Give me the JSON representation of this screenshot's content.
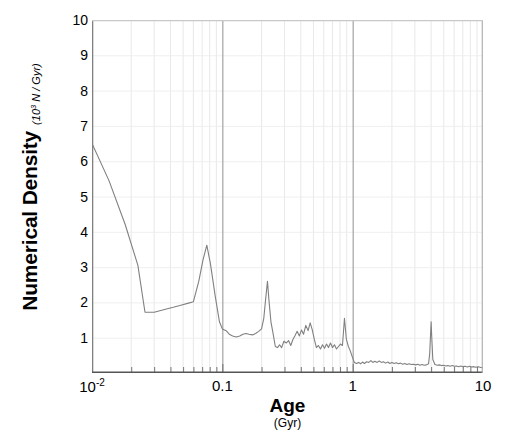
{
  "axes": {
    "y_title": "Numerical Density",
    "y_subtitle_pre": "(10",
    "y_subtitle_sup": "3",
    "y_subtitle_post": " N / Gyr)",
    "x_title": "Age",
    "x_subtitle": "(Gyr)"
  },
  "chart_data": {
    "type": "line",
    "title": "",
    "xlabel": "Age (Gyr)",
    "ylabel": "Numerical Density (10^3 N / Gyr)",
    "xscale": "log",
    "yscale": "linear",
    "xlim": [
      0.01,
      10
    ],
    "ylim": [
      0,
      10
    ],
    "grid": true,
    "grid_minor": true,
    "legend": null,
    "line_color": "#808080",
    "y_ticks": [
      1,
      2,
      3,
      4,
      5,
      6,
      7,
      8,
      9,
      10
    ],
    "y_ticklabels": [
      "1",
      "2",
      "3",
      "4",
      "5",
      "6",
      "7",
      "8",
      "9",
      "10"
    ],
    "x_ticks": [
      0.01,
      0.1,
      1,
      10
    ],
    "x_ticklabels": [
      "10-2",
      "0.1",
      "1",
      "10"
    ],
    "series": [
      {
        "name": "numerical density",
        "x": [
          0.01,
          0.0135,
          0.018,
          0.0225,
          0.0255,
          0.03,
          0.036,
          0.042,
          0.048,
          0.055,
          0.06,
          0.066,
          0.071,
          0.076,
          0.081,
          0.088,
          0.095,
          0.1,
          0.107,
          0.113,
          0.12,
          0.128,
          0.136,
          0.144,
          0.152,
          0.16,
          0.17,
          0.18,
          0.19,
          0.2,
          0.208,
          0.215,
          0.222,
          0.228,
          0.236,
          0.245,
          0.255,
          0.265,
          0.275,
          0.285,
          0.297,
          0.31,
          0.322,
          0.335,
          0.348,
          0.36,
          0.375,
          0.39,
          0.405,
          0.42,
          0.437,
          0.455,
          0.472,
          0.49,
          0.508,
          0.527,
          0.546,
          0.566,
          0.587,
          0.608,
          0.63,
          0.652,
          0.676,
          0.7,
          0.725,
          0.751,
          0.778,
          0.806,
          0.835,
          0.865,
          0.895,
          0.927,
          0.96,
          0.995,
          1.03,
          1.07,
          1.11,
          1.15,
          1.19,
          1.23,
          1.28,
          1.33,
          1.38,
          1.43,
          1.48,
          1.54,
          1.6,
          1.66,
          1.72,
          1.79,
          1.86,
          1.93,
          2.0,
          2.08,
          2.16,
          2.24,
          2.33,
          2.42,
          2.51,
          2.61,
          2.71,
          2.82,
          2.93,
          3.04,
          3.16,
          3.28,
          3.41,
          3.54,
          3.68,
          3.82,
          3.9,
          3.96,
          4.0,
          4.04,
          4.12,
          4.28,
          4.45,
          4.62,
          4.8,
          4.99,
          5.18,
          5.38,
          5.59,
          5.81,
          6.03,
          6.27,
          6.51,
          6.76,
          7.03,
          7.3,
          7.58,
          7.88,
          8.18,
          8.5,
          8.83,
          9.17,
          9.53,
          10.0
        ],
        "y": [
          6.5,
          5.45,
          4.2,
          3.05,
          1.72,
          1.72,
          1.8,
          1.86,
          1.92,
          1.98,
          2.02,
          2.6,
          3.2,
          3.62,
          3.1,
          2.2,
          1.45,
          1.25,
          1.2,
          1.1,
          1.05,
          1.02,
          1.05,
          1.1,
          1.12,
          1.1,
          1.08,
          1.12,
          1.18,
          1.25,
          1.55,
          2.1,
          2.6,
          2.05,
          1.45,
          1.12,
          0.75,
          0.72,
          0.8,
          0.72,
          0.9,
          0.85,
          0.92,
          0.78,
          0.95,
          1.05,
          1.18,
          1.05,
          1.22,
          1.1,
          1.35,
          1.2,
          1.42,
          1.22,
          0.95,
          0.72,
          0.78,
          0.68,
          0.8,
          0.7,
          0.82,
          0.72,
          0.85,
          0.72,
          0.8,
          0.68,
          0.75,
          0.82,
          0.78,
          1.55,
          0.95,
          0.75,
          0.62,
          0.45,
          0.3,
          0.27,
          0.3,
          0.26,
          0.31,
          0.27,
          0.32,
          0.3,
          0.35,
          0.3,
          0.33,
          0.3,
          0.34,
          0.3,
          0.32,
          0.28,
          0.31,
          0.27,
          0.3,
          0.27,
          0.29,
          0.26,
          0.28,
          0.25,
          0.27,
          0.24,
          0.26,
          0.24,
          0.25,
          0.23,
          0.25,
          0.22,
          0.24,
          0.22,
          0.23,
          0.26,
          0.55,
          1.1,
          1.45,
          1.05,
          0.38,
          0.24,
          0.22,
          0.23,
          0.21,
          0.22,
          0.2,
          0.21,
          0.19,
          0.21,
          0.19,
          0.2,
          0.18,
          0.2,
          0.18,
          0.19,
          0.17,
          0.19,
          0.17,
          0.18,
          0.16,
          0.18,
          0.16,
          0.15
        ]
      }
    ]
  }
}
